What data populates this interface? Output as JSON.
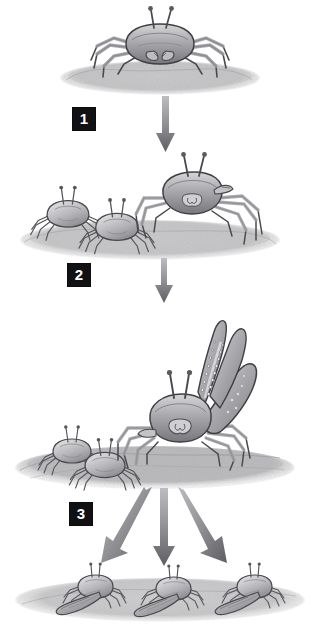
{
  "figure": {
    "domain": "scientific-illustration",
    "title": "",
    "background_color": "#ffffff",
    "ink_color": "#4a4a4e",
    "arrow_color": "#7d7d82",
    "label_bg_color": "#111113",
    "label_text_color": "#ffffff",
    "width": 319,
    "height": 630
  },
  "stages": [
    {
      "number": "1",
      "label_text": "1",
      "caption": "",
      "crab_count": 1,
      "description": "single crab on sandy mound, legs spread, eyestalks raised, no enlarged claw",
      "ground": "sand mound"
    },
    {
      "number": "2",
      "label_text": "2",
      "caption": "",
      "crab_count": 3,
      "description": "two small crabs at left and one larger raised crab at right standing tall on sand",
      "ground": "sand mound"
    },
    {
      "number": "3",
      "label_text": "3",
      "caption": "",
      "crab_count": 3,
      "description": "large fiddler crab with one greatly enlarged serrated claw raised upward, two smaller crabs at left on sand",
      "ground": "sand mound"
    }
  ],
  "outcome_row": {
    "crab_count": 3,
    "description": "three fiddler crabs each with one enlarged claw extended forward, resting on sand",
    "items": [
      {
        "index": "1",
        "description": "fiddler crab with large claw pointing left"
      },
      {
        "index": "2",
        "description": "fiddler crab with large claw pointing left"
      },
      {
        "index": "3",
        "description": "fiddler crab with large claw pointing left"
      }
    ]
  },
  "arrows": [
    {
      "name": "arrow-stage1-to-stage2",
      "direction": "down",
      "from": "1",
      "to": "2"
    },
    {
      "name": "arrow-stage2-to-stage3",
      "direction": "down",
      "from": "2",
      "to": "3"
    },
    {
      "name": "arrow-stage3-to-outcome-left",
      "direction": "down-left",
      "from": "3",
      "to": "outcome-1"
    },
    {
      "name": "arrow-stage3-to-outcome-center",
      "direction": "down",
      "from": "3",
      "to": "outcome-2"
    },
    {
      "name": "arrow-stage3-to-outcome-right",
      "direction": "down-right",
      "from": "3",
      "to": "outcome-3"
    }
  ]
}
